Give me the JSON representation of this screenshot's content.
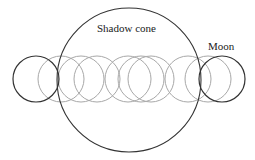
{
  "diagram": {
    "type": "lunar-eclipse-path",
    "labels": {
      "shadow_cone": "Shadow cone",
      "moon": "Moon"
    },
    "colors": {
      "background": "#ffffff",
      "outline_dark": "#333333",
      "outline_light": "#a8a8a8",
      "text": "#1a1a1a"
    },
    "shadow_cone": {
      "cx": 129,
      "cy": 80,
      "r": 72
    },
    "moon_radius": 23,
    "moon_path_y": 79,
    "moon_positions": [
      {
        "cx": 36,
        "style": "dark"
      },
      {
        "cx": 61,
        "style": "light"
      },
      {
        "cx": 81,
        "style": "light"
      },
      {
        "cx": 97,
        "style": "light"
      },
      {
        "cx": 128,
        "style": "light"
      },
      {
        "cx": 141,
        "style": "light"
      },
      {
        "cx": 151,
        "style": "light"
      },
      {
        "cx": 188,
        "style": "light"
      },
      {
        "cx": 208,
        "style": "light"
      },
      {
        "cx": 222,
        "style": "dark"
      }
    ]
  }
}
